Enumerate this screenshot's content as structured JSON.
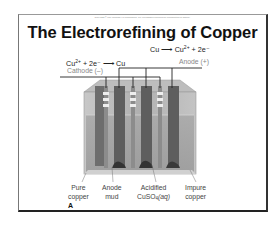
{
  "slide": {
    "copyright": "Copyright © The McGraw-Hill Companies, Inc. Permission required for reproduction or display.",
    "title": "The Electrorefining of Copper",
    "anode_equation": {
      "left": "Cu",
      "arrow": "→",
      "product": "Cu",
      "charge": "2+",
      "rest": " + 2e⁻"
    },
    "cathode_equation": {
      "reactant": "Cu",
      "charge": "2+",
      "rest": " + 2e⁻ ",
      "arrow": "→",
      "product": " Cu"
    },
    "anode_label": "Anode (+)",
    "cathode_label": "Cathode (–)",
    "labels": {
      "pure_copper": [
        "Pure",
        "copper"
      ],
      "anode_mud": [
        "Anode",
        "mud"
      ],
      "acidified": [
        "Acidified",
        "CuSO",
        "4",
        "(aq)"
      ],
      "impure_copper": [
        "Impure",
        "copper"
      ]
    },
    "panel_letter": "A"
  },
  "colors": {
    "frame": "#222222",
    "tank": "#b8b8b8",
    "electrode_dark": "#5a5a5a",
    "electrode_light": "#8a8a8a",
    "wire": "#222222",
    "grey_label": "#888888"
  }
}
